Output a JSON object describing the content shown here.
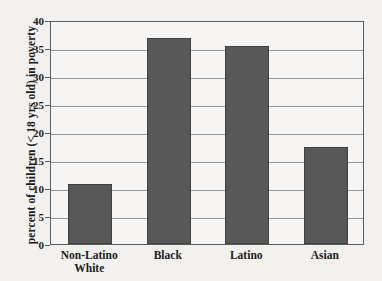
{
  "chart_data": {
    "type": "bar",
    "title": "",
    "xlabel": "",
    "ylabel": "percent of children (< 18 yrs old) in poverty",
    "categories": [
      "Non-Latino White",
      "Black",
      "Latino",
      "Asian"
    ],
    "category_lines": [
      [
        "Non-Latino",
        "White"
      ],
      [
        "Black"
      ],
      [
        "Latino"
      ],
      [
        "Asian"
      ]
    ],
    "values": [
      10.8,
      36.8,
      35.4,
      17.4
    ],
    "ylim": [
      0,
      40
    ],
    "ytick_labels": [
      "0",
      "5",
      "10",
      "15",
      "20",
      "25",
      "30",
      "35",
      "40"
    ],
    "ytick_values": [
      0,
      5,
      10,
      15,
      20,
      25,
      30,
      35,
      40
    ],
    "grid": "horizontal",
    "legend": "none",
    "bar_color": "#585858",
    "frame_color": "#5c5c5c",
    "gridline_color": "#9a9a9a",
    "background_color": "#f3f1ef",
    "plot_background_color": "#f6f5f3"
  }
}
